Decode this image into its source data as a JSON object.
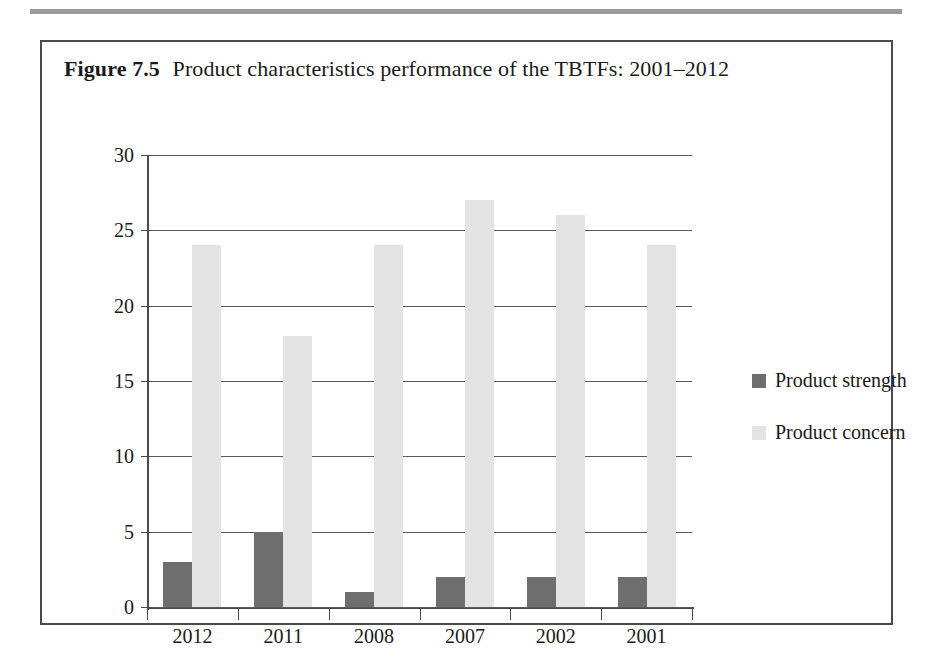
{
  "figure": {
    "label": "Figure",
    "number": "7.5",
    "caption": "Product characteristics performance of the TBTFs: 2001–2012"
  },
  "colors": {
    "strength": "#6e6e6e",
    "concern": "#e3e3e3",
    "axis": "#4a4a4a",
    "gridline": "#5a5a5a",
    "top_rule": "#9a9a9a",
    "frame": "#4a4a4a",
    "text": "#1a1a1a"
  },
  "legend": {
    "position": "right",
    "items": [
      {
        "label": "Product strength",
        "color": "#6e6e6e"
      },
      {
        "label": "Product concern",
        "color": "#e3e3e3"
      }
    ]
  },
  "chart_data": {
    "type": "bar",
    "title": "Figure 7.5 Product characteristics performance of the TBTFs: 2001–2012",
    "xlabel": "",
    "ylabel": "",
    "categories": [
      "2012",
      "2011",
      "2008",
      "2007",
      "2002",
      "2001"
    ],
    "series": [
      {
        "name": "Product strength",
        "color": "#6e6e6e",
        "values": [
          3,
          5,
          1,
          2,
          2,
          2
        ]
      },
      {
        "name": "Product concern",
        "color": "#e3e3e3",
        "values": [
          24,
          18,
          24,
          27,
          26,
          24
        ]
      }
    ],
    "ylim": [
      0,
      30
    ],
    "yticks": [
      0,
      5,
      10,
      15,
      20,
      25,
      30
    ],
    "ytick_labels": [
      "0",
      "5",
      "10",
      "15",
      "20",
      "25",
      "30"
    ],
    "grid": true,
    "grid_axis": "y",
    "legend_position": "right",
    "bar_mode": "grouped"
  }
}
